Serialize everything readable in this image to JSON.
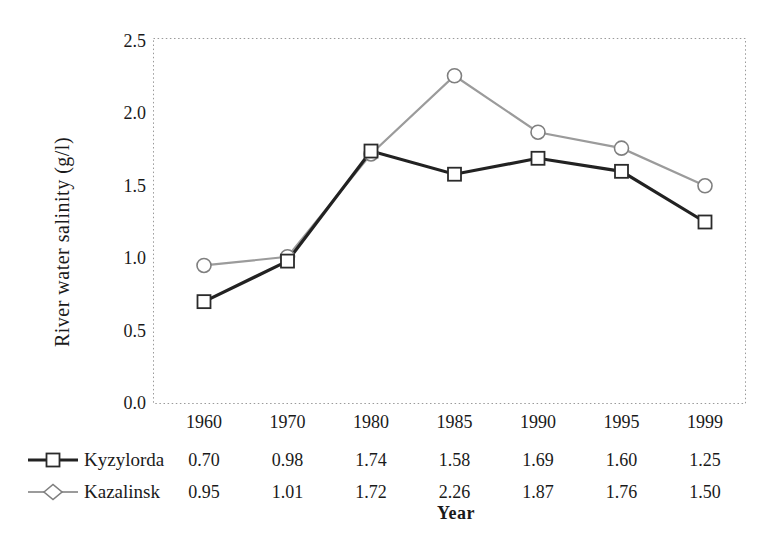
{
  "chart_data": {
    "type": "line",
    "title": "",
    "xlabel": "Year",
    "ylabel": "River water salinity (g/l)",
    "ylim": [
      0,
      2.5
    ],
    "ytick_labels": [
      "0.0",
      "0.5",
      "1.0",
      "1.5",
      "2.0",
      "2.5"
    ],
    "grid": false,
    "frame_style": "dotted",
    "legend_position": "bottom-left-table",
    "categories": [
      "1960",
      "1970",
      "1980",
      "1985",
      "1990",
      "1995",
      "1999"
    ],
    "series": [
      {
        "name": "Kyzylorda",
        "marker": "square",
        "line_color": "#222222",
        "marker_color": "#2b2b2b",
        "line_width": 3.2,
        "values": [
          0.7,
          0.98,
          1.74,
          1.58,
          1.69,
          1.6,
          1.25
        ],
        "value_labels": [
          "0.70",
          "0.98",
          "1.74",
          "1.58",
          "1.69",
          "1.60",
          "1.25"
        ]
      },
      {
        "name": "Kazalinsk",
        "marker": "circle",
        "line_color": "#9b9b9b",
        "marker_color": "#7f7f7f",
        "line_width": 2.2,
        "values": [
          0.95,
          1.01,
          1.72,
          2.26,
          1.87,
          1.76,
          1.5
        ],
        "value_labels": [
          "0.95",
          "1.01",
          "1.72",
          "2.26",
          "1.87",
          "1.76",
          "1.50"
        ]
      }
    ],
    "colors": {
      "frame": "#9a9a9a",
      "text": "#1a1a1a",
      "background": "#ffffff"
    }
  }
}
